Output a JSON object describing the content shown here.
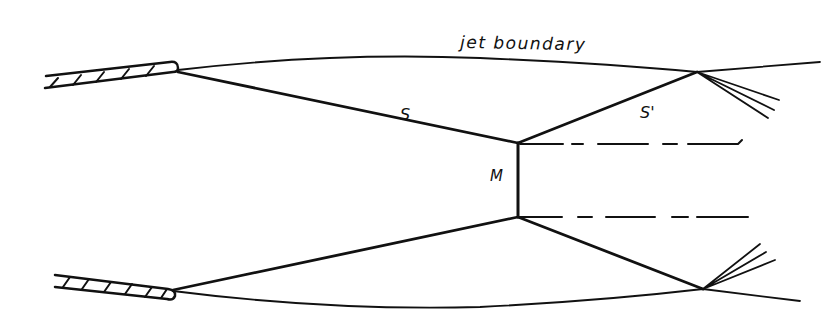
{
  "diagram": {
    "type": "jet shock structure (Mach disk) schematic",
    "labels": {
      "jet_boundary": "jet boundary",
      "incident_shock": "S",
      "reflected_shock": "S'",
      "mach_disk": "M"
    },
    "elements": [
      {
        "name": "upper nozzle lip",
        "kind": "hatched wall"
      },
      {
        "name": "lower nozzle lip",
        "kind": "hatched wall"
      },
      {
        "name": "upper jet boundary",
        "kind": "curve"
      },
      {
        "name": "lower jet boundary",
        "kind": "curve"
      },
      {
        "name": "incident shock S (upper)",
        "kind": "line"
      },
      {
        "name": "incident shock (lower)",
        "kind": "line"
      },
      {
        "name": "reflected shock S' (upper)",
        "kind": "line"
      },
      {
        "name": "reflected shock (lower)",
        "kind": "line"
      },
      {
        "name": "Mach disk M",
        "kind": "vertical line"
      },
      {
        "name": "slip lines",
        "kind": "dashed lines",
        "count": 2
      },
      {
        "name": "expansion fans",
        "kind": "line bundles",
        "count": 2
      }
    ],
    "colors": {
      "ink": "#111111",
      "background": "#ffffff"
    }
  }
}
